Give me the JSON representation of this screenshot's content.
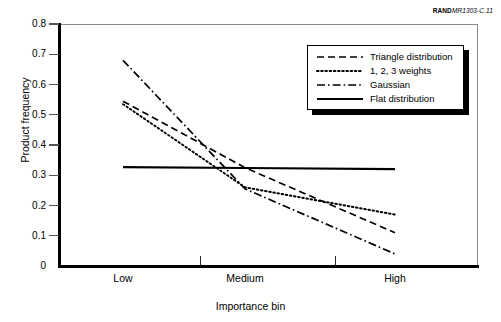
{
  "figure": {
    "source_caption_bold": "RAND",
    "source_caption_italic": "MR1303-C.11"
  },
  "chart_data": {
    "type": "line",
    "title": "",
    "xlabel": "Importance bin",
    "ylabel": "Product frequency",
    "categories": [
      "Low",
      "Medium",
      "High"
    ],
    "xlim": [
      0,
      2
    ],
    "ylim": [
      0,
      0.8
    ],
    "ytick_labels": [
      "0",
      "0.1",
      "0.2",
      "0.3",
      "0.4",
      "0.5",
      "0.6",
      "0.7",
      "0.8"
    ],
    "ytick_values": [
      0,
      0.1,
      0.2,
      0.3,
      0.4,
      0.5,
      0.6,
      0.7,
      0.8
    ],
    "grid": false,
    "legend_position": "top-right",
    "series": [
      {
        "name": "Triangle distribution",
        "style": "dashed",
        "values": [
          0.545,
          0.325,
          0.11
        ]
      },
      {
        "name": "1, 2, 3 weights",
        "style": "dotted",
        "values": [
          0.535,
          0.26,
          0.17
        ]
      },
      {
        "name": "Gaussian",
        "style": "dash-dot",
        "values": [
          0.68,
          0.255,
          0.04
        ]
      },
      {
        "name": "Flat distribution",
        "style": "solid",
        "values": [
          0.327,
          0.324,
          0.32
        ]
      }
    ]
  }
}
